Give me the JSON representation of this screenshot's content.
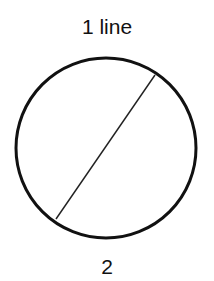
{
  "title": "1 line",
  "answer": "2",
  "diagram": {
    "circle": {
      "cx": 106,
      "cy": 148,
      "r": 90,
      "stroke": "#111111",
      "stroke_width": 3
    },
    "chord": {
      "x1": 155,
      "y1": 75,
      "x2": 56,
      "y2": 219,
      "stroke": "#222222",
      "stroke_width": 1.5
    },
    "regions": 2
  }
}
